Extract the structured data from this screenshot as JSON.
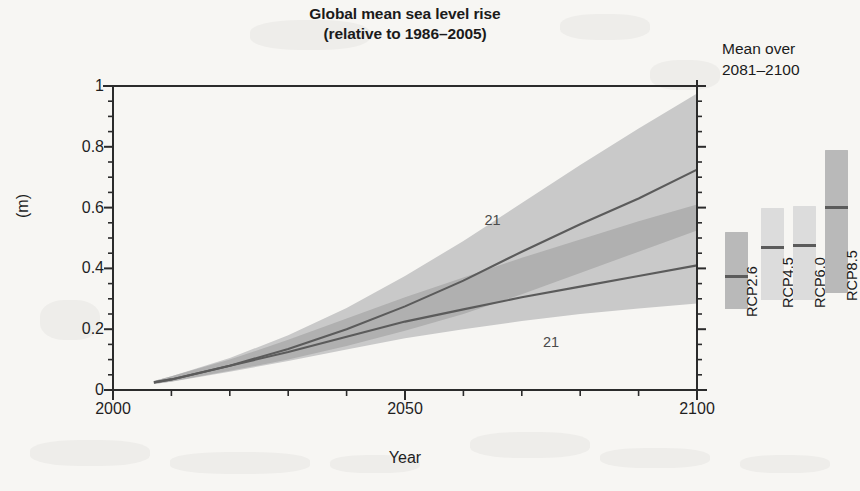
{
  "chart_data": {
    "type": "area",
    "title": "Global mean sea level rise",
    "subtitle": "(relative to 1986–2005)",
    "xlabel": "Year",
    "ylabel": "(m)",
    "xlim": [
      2000,
      2100
    ],
    "ylim": [
      0,
      1
    ],
    "grid": false,
    "legend_position": "right-panel",
    "x_ticks_major": [
      2000,
      2050,
      2100
    ],
    "x_tick_labels": [
      "2000",
      "2050",
      "2100"
    ],
    "x_ticks_minor": [
      2010,
      2020,
      2030,
      2040,
      2060,
      2070,
      2080,
      2090
    ],
    "y_ticks_major": [
      0,
      0.2,
      0.4,
      0.6,
      0.8,
      1
    ],
    "y_tick_labels": [
      "0",
      "0.2",
      "0.4",
      "0.6",
      "0.8",
      "1"
    ],
    "y_ticks_minor": [
      0.05,
      0.1,
      0.15,
      0.25,
      0.3,
      0.35,
      0.45,
      0.5,
      0.55,
      0.65,
      0.7,
      0.75,
      0.85,
      0.9,
      0.95
    ],
    "x": [
      2007,
      2010,
      2020,
      2030,
      2040,
      2050,
      2060,
      2070,
      2080,
      2090,
      2100
    ],
    "series": [
      {
        "name": "RCP8.5",
        "median": [
          0.025,
          0.035,
          0.08,
          0.135,
          0.2,
          0.275,
          0.36,
          0.455,
          0.545,
          0.63,
          0.725
        ],
        "upper": [
          0.03,
          0.045,
          0.105,
          0.18,
          0.27,
          0.375,
          0.49,
          0.615,
          0.74,
          0.86,
          0.975
        ],
        "lower": [
          0.02,
          0.028,
          0.063,
          0.1,
          0.145,
          0.195,
          0.25,
          0.315,
          0.385,
          0.455,
          0.525
        ],
        "annotation": "21",
        "band_color": "#c9c9c9",
        "line_color": "#5b5b5b"
      },
      {
        "name": "RCP2.6",
        "median": [
          0.025,
          0.035,
          0.08,
          0.125,
          0.175,
          0.225,
          0.265,
          0.305,
          0.34,
          0.375,
          0.41
        ],
        "upper": [
          0.03,
          0.045,
          0.1,
          0.165,
          0.235,
          0.305,
          0.37,
          0.435,
          0.495,
          0.555,
          0.61
        ],
        "lower": [
          0.02,
          0.027,
          0.06,
          0.095,
          0.133,
          0.17,
          0.2,
          0.227,
          0.25,
          0.268,
          0.285
        ],
        "annotation": "21",
        "band_color": "#c9c9c9",
        "line_color": "#5b5b5b"
      }
    ],
    "overlap_color": "#b0b0b0",
    "annotations": [
      {
        "text": "21",
        "x": 2065,
        "y": 0.56
      },
      {
        "text": "21",
        "x": 2075,
        "y": 0.158
      }
    ],
    "side_panel": {
      "title_line1": "Mean over",
      "title_line2": "2081–2100",
      "bars": [
        {
          "label": "RCP2.6",
          "low": 0.265,
          "high": 0.52,
          "median": 0.375,
          "color": "#b9b9b9"
        },
        {
          "label": "RCP4.5",
          "low": 0.295,
          "high": 0.6,
          "median": 0.47,
          "color": "#dcdcdc"
        },
        {
          "label": "RCP6.0",
          "low": 0.295,
          "high": 0.605,
          "median": 0.475,
          "color": "#dcdcdc"
        },
        {
          "label": "RCP8.5",
          "low": 0.32,
          "high": 0.79,
          "median": 0.6,
          "color": "#b9b9b9"
        }
      ]
    }
  }
}
